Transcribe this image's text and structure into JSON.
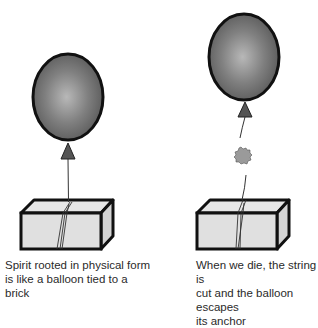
{
  "diagram": {
    "panels": [
      {
        "id": "left",
        "state": "balloon tied to brick",
        "caption": "Spirit rooted in physical form\nis like a balloon tied to a brick",
        "elements": [
          "balloon",
          "balloon-knot",
          "string",
          "brick"
        ]
      },
      {
        "id": "right",
        "state": "string cut, balloon escapes",
        "caption": "When we die, the string is\ncut and the balloon escapes\nits anchor",
        "elements": [
          "balloon",
          "balloon-knot",
          "string-upper",
          "cut-burst",
          "string-lower",
          "brick"
        ]
      }
    ],
    "colors": {
      "balloon_center": "#b8b8b8",
      "balloon_edge": "#5a5a5a",
      "outline": "#111111",
      "brick_face": "#e0e0e0",
      "brick_side": "#d4d4d4",
      "knot": "#555555",
      "burst": "#9a9a9a",
      "text": "#2a2a2a"
    }
  }
}
